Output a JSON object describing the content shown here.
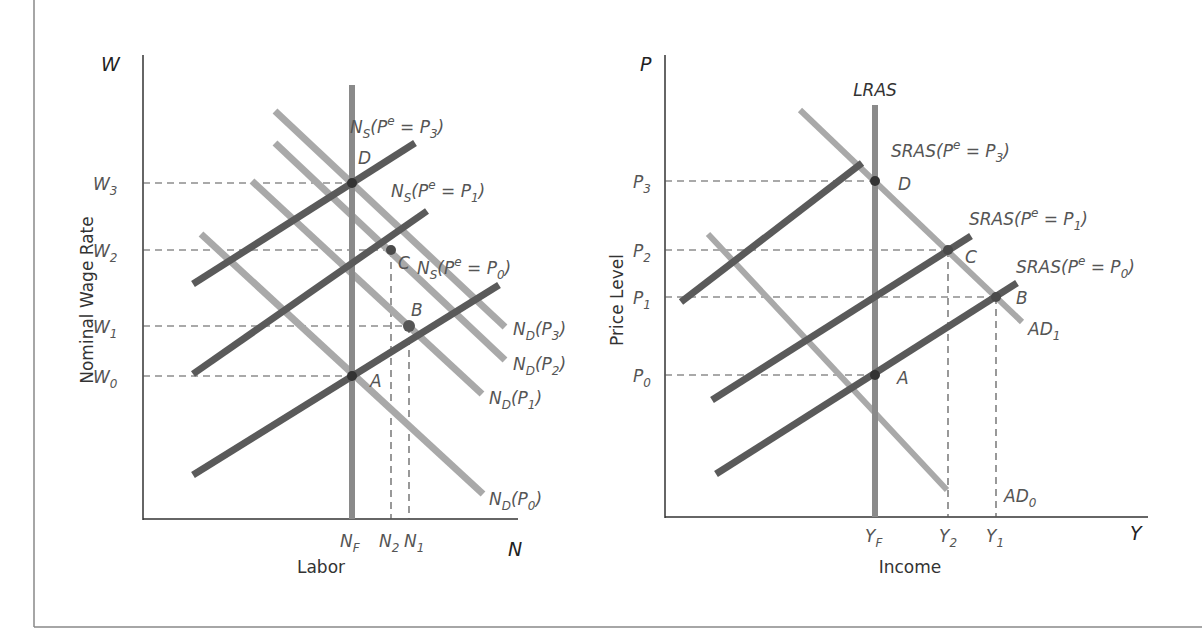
{
  "colors": {
    "supply_curves": "#5a5a5a",
    "demand_curves": "#a9a9a9",
    "vertical_line": "#8a8a8a",
    "axis": "#333333",
    "dashed": "#555555",
    "frame": "#888888",
    "text": "#555555"
  },
  "left_panel": {
    "y_axis_symbol": "W",
    "x_axis_symbol": "N",
    "y_axis_title": "Nominal Wage Rate",
    "x_axis_title": "Labor",
    "y_ticks": [
      {
        "base": "W",
        "sub": "3"
      },
      {
        "base": "W",
        "sub": "2"
      },
      {
        "base": "W",
        "sub": "1"
      },
      {
        "base": "W",
        "sub": "0"
      }
    ],
    "x_ticks": [
      {
        "base": "N",
        "sub": "F"
      },
      {
        "base": "N",
        "sub": "2"
      },
      {
        "base": "N",
        "sub": "1"
      }
    ],
    "supply_labels": [
      {
        "pre": "N",
        "sub": "S",
        "mid": "(P",
        "sup": "e",
        "eq": " = P",
        "psub": "3",
        "post": ")"
      },
      {
        "pre": "N",
        "sub": "S",
        "mid": "(P",
        "sup": "e",
        "eq": " = P",
        "psub": "1",
        "post": ")"
      },
      {
        "pre": "N",
        "sub": "S",
        "mid": "(P",
        "sup": "e",
        "eq": " = P",
        "psub": "0",
        "post": ")"
      }
    ],
    "demand_labels": [
      {
        "pre": "N",
        "sub": "D",
        "mid": "(P",
        "psub": "3",
        "post": ")"
      },
      {
        "pre": "N",
        "sub": "D",
        "mid": "(P",
        "psub": "2",
        "post": ")"
      },
      {
        "pre": "N",
        "sub": "D",
        "mid": "(P",
        "psub": "1",
        "post": ")"
      },
      {
        "pre": "N",
        "sub": "D",
        "mid": "(P",
        "psub": "0",
        "post": ")"
      }
    ],
    "points": {
      "A": "A",
      "B": "B",
      "C": "C",
      "D": "D"
    }
  },
  "right_panel": {
    "y_axis_symbol": "P",
    "x_axis_symbol": "Y",
    "y_axis_title": "Price Level",
    "x_axis_title": "Income",
    "vertical_label": "LRAS",
    "y_ticks": [
      {
        "base": "P",
        "sub": "3"
      },
      {
        "base": "P",
        "sub": "2"
      },
      {
        "base": "P",
        "sub": "1"
      },
      {
        "base": "P",
        "sub": "0"
      }
    ],
    "x_ticks": [
      {
        "base": "Y",
        "sub": "F"
      },
      {
        "base": "Y",
        "sub": "2"
      },
      {
        "base": "Y",
        "sub": "1"
      }
    ],
    "supply_labels": [
      {
        "pre": "SRAS",
        "mid": "(P",
        "sup": "e",
        "eq": " = P",
        "psub": "3",
        "post": ")"
      },
      {
        "pre": "SRAS",
        "mid": "(P",
        "sup": "e",
        "eq": " = P",
        "psub": "1",
        "post": ")"
      },
      {
        "pre": "SRAS",
        "mid": "(P",
        "sup": "e",
        "eq": " = P",
        "psub": "0",
        "post": ")"
      }
    ],
    "demand_labels": [
      {
        "pre": "AD",
        "sub": "1"
      },
      {
        "pre": "AD",
        "sub": "0"
      }
    ],
    "points": {
      "A": "A",
      "B": "B",
      "C": "C",
      "D": "D"
    }
  }
}
